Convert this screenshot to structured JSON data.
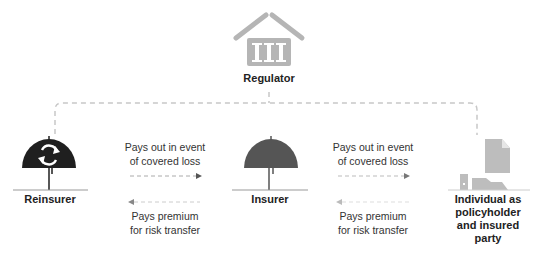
{
  "diagram": {
    "regulator": {
      "label": "Regulator",
      "icon": "bank-building-icon",
      "color": "#b5b5b5"
    },
    "reinsurer": {
      "label": "Reinsurer",
      "icon": "umbrella-recycle-icon",
      "color": "#1f1f1f"
    },
    "insurer": {
      "label": "Insurer",
      "icon": "umbrella-icon",
      "color": "#555555"
    },
    "individual": {
      "label_lines": [
        "Individual as",
        "policyholder",
        "and insured",
        "party"
      ],
      "icon": "person-document-icon",
      "color": "#b5b5b5"
    },
    "flows": [
      {
        "between": "reinsurer-insurer",
        "top_lines": [
          "Pays out in event",
          "of covered loss"
        ],
        "bottom_lines": [
          "Pays premium",
          "for risk transfer"
        ]
      },
      {
        "between": "insurer-individual",
        "top_lines": [
          "Pays out in event",
          "of covered loss"
        ],
        "bottom_lines": [
          "Pays premium",
          "for risk transfer"
        ]
      }
    ],
    "connector_color": "#c8c8c8"
  }
}
